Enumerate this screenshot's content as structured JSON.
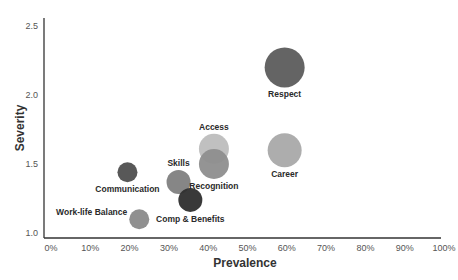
{
  "chart_data": {
    "type": "scatter",
    "subtype": "bubble",
    "title": "",
    "xlabel": "Prevalence",
    "ylabel": "Severity",
    "xlim": [
      0,
      100
    ],
    "ylim": [
      1.0,
      2.5
    ],
    "x_ticks": [
      "0%",
      "10%",
      "20%",
      "30%",
      "40%",
      "50%",
      "60%",
      "70%",
      "80%",
      "90%",
      "100%"
    ],
    "y_ticks": [
      "1.0",
      "1.5",
      "2.0",
      "2.5"
    ],
    "grid": false,
    "legend": "none",
    "points": [
      {
        "label": "Respect",
        "x": 62,
        "y": 2.2,
        "size": 20,
        "color": "#5c5c5c",
        "label_pos": "below"
      },
      {
        "label": "Career",
        "x": 62,
        "y": 1.6,
        "size": 17,
        "color": "#a9a9a9",
        "label_pos": "below"
      },
      {
        "label": "Access",
        "x": 44,
        "y": 1.61,
        "size": 15,
        "color": "#bdbdbd",
        "label_pos": "above"
      },
      {
        "label": "Recognition",
        "x": 44,
        "y": 1.5,
        "size": 15,
        "color": "#8e8e8e",
        "label_pos": "below"
      },
      {
        "label": "Skills",
        "x": 35,
        "y": 1.37,
        "size": 12,
        "color": "#7f7f7f",
        "label_pos": "above"
      },
      {
        "label": "Comp & Benefits",
        "x": 38,
        "y": 1.24,
        "size": 12,
        "color": "#2e2e2e",
        "label_pos": "below"
      },
      {
        "label": "Communication",
        "x": 22,
        "y": 1.44,
        "size": 10,
        "color": "#4f4f4f",
        "label_pos": "below"
      },
      {
        "label": "Work-life Balance",
        "x": 25,
        "y": 1.1,
        "size": 10,
        "color": "#8a8a8a",
        "label_pos": "left"
      }
    ]
  },
  "axes": {
    "x_title": "Prevalence",
    "y_title": "Severity"
  }
}
